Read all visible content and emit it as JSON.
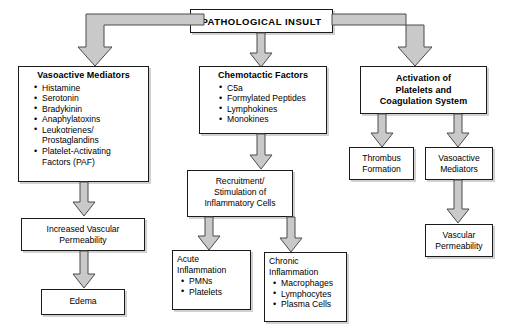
{
  "diagram": {
    "title": "PATHOLOGICAL INSULT",
    "root": {
      "label": "PATHOLOGICAL INSULT"
    },
    "branches": {
      "vasoactive_mediators": {
        "heading": "Vasoactive Mediators",
        "items": [
          "Histamine",
          "Serotonin",
          "Bradykinin",
          "Anaphylatoxins",
          "Leukotrienes/",
          "Prostaglandins",
          "Platelet-Activating",
          "Factors (PAF)"
        ],
        "item_1": "Histamine",
        "item_2": "Serotonin",
        "item_3": "Bradykinin",
        "item_4": "Anaphylatoxins",
        "item_5_line1": "Leukotrienes/",
        "item_5_line2": "Prostaglandins",
        "item_6_line1": "Platelet-Activating",
        "item_6_line2": "Factors (PAF)"
      },
      "chemotactic_factors": {
        "heading": "Chemotactic Factors",
        "items": [
          "C5a",
          "Formylated Peptides",
          "Lymphokines",
          "Monokines"
        ],
        "item_1": "C5a",
        "item_2": "Formylated Peptides",
        "item_3": "Lymphokines",
        "item_4": "Monokines"
      },
      "activation": {
        "heading_line1": "Activation of",
        "heading_line2": "Platelets and",
        "heading_line3": "Coagulation System"
      }
    },
    "nodes": {
      "increased_vascular_permeability": {
        "line1": "Increased Vascular",
        "line2": "Permeability"
      },
      "edema": {
        "line1": "Edema"
      },
      "recruitment": {
        "line1": "Recruitment/",
        "line2": "Stimulation of",
        "line3": "Inflammatory Cells"
      },
      "acute_inflammation": {
        "line1": "Acute",
        "line2": "Inflammation",
        "items": [
          "PMNs",
          "Platelets"
        ],
        "item_1": "PMNs",
        "item_2": "Platelets"
      },
      "chronic_inflammation": {
        "line1": "Chronic",
        "line2": "Inflammation",
        "items": [
          "Macrophages",
          "Lymphocytes",
          "Plasma Cells"
        ],
        "item_1": "Macrophages",
        "item_2": "Lymphocytes",
        "item_3": "Plasma Cells"
      },
      "thrombus_formation": {
        "line1": "Thrombus",
        "line2": "Formation"
      },
      "vasoactive_mediators_right": {
        "line1": "Vasoactive",
        "line2": "Mediators"
      },
      "vascular_permeability": {
        "line1": "Vascular",
        "line2": "Permeability"
      }
    },
    "bullet_glyph": "•",
    "colors": {
      "box_border": "#1a1a1a",
      "box_fill": "#ffffff",
      "arrow_fill": "#c9c9c9",
      "arrow_stroke": "#4a4a4a",
      "text": "#000000",
      "background": "#ffffff"
    }
  }
}
